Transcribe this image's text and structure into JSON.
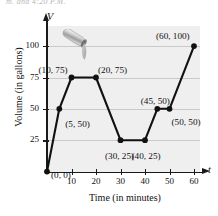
{
  "figure": {
    "top_cutoff_text": "m. and 4:20 P.M.",
    "faucet_icon": "hose-nozzle-pouring-water"
  },
  "chart_data": {
    "type": "line",
    "title": "",
    "xlabel": "Time (in minutes)",
    "ylabel": "Volume (in gallons)",
    "x_axis_variable": "t",
    "y_axis_variable": "V",
    "xlim": [
      0,
      65
    ],
    "ylim": [
      0,
      110
    ],
    "grid": true,
    "legend": null,
    "x_ticks": [
      10,
      20,
      30,
      40,
      50,
      60
    ],
    "y_ticks": [
      25,
      50,
      75,
      100
    ],
    "x": [
      0,
      5,
      10,
      20,
      30,
      40,
      45,
      50,
      60
    ],
    "y": [
      0,
      50,
      75,
      75,
      25,
      25,
      50,
      50,
      100
    ],
    "points": [
      {
        "x": 0,
        "y": 0,
        "label": "(0, 0)"
      },
      {
        "x": 5,
        "y": 50,
        "label": "(5, 50)"
      },
      {
        "x": 10,
        "y": 75,
        "label": "(10, 75)"
      },
      {
        "x": 20,
        "y": 75,
        "label": "(20, 75)"
      },
      {
        "x": 30,
        "y": 25,
        "label": "(30, 25)"
      },
      {
        "x": 40,
        "y": 25,
        "label": "(40, 25)"
      },
      {
        "x": 45,
        "y": 50,
        "label": "(45, 50)"
      },
      {
        "x": 50,
        "y": 50,
        "label": "(50, 50)"
      },
      {
        "x": 60,
        "y": 100,
        "label": "(60, 100)"
      }
    ],
    "tick_labels": {
      "x": [
        "10",
        "20",
        "30",
        "40",
        "50",
        "60"
      ],
      "y": [
        "25",
        "50",
        "75",
        "100"
      ]
    },
    "colors": {
      "line": "#111111",
      "marker": "#111111",
      "panel": "#efefef",
      "grid": "#c9c9c9",
      "axis": "#1a1a1a"
    }
  }
}
